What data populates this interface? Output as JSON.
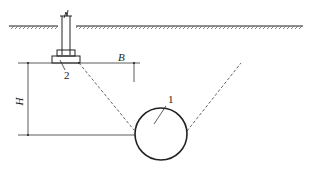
{
  "diagram": {
    "type": "engineering-section",
    "labels": {
      "tunnel_number": "1",
      "footing_number": "2",
      "horizontal_distance": "B",
      "vertical_depth": "H"
    },
    "colors": {
      "line": "#222222",
      "dashed": "#555555",
      "hatch": "#666666"
    }
  }
}
